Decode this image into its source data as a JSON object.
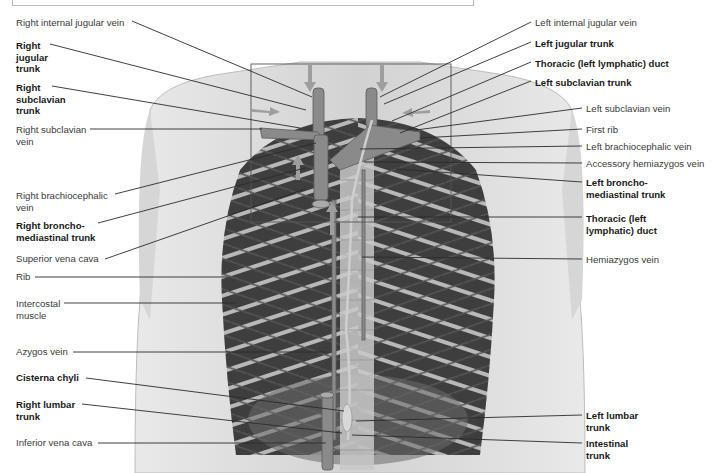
{
  "figure": {
    "inset_box": "highlighted region of jugular, subclavian and bronchomediastinal trunks",
    "colors": {
      "background": "#ffffff",
      "skin": "#dcdcdc",
      "muscle_dark": "#3c3c3c",
      "vessel": "#8a8a8a",
      "line": "#2b2b2b",
      "arrow": "#9a9a9a"
    }
  },
  "labels_left": [
    {
      "id": "right-internal-jugular-vein",
      "text": "Right internal jugular vein",
      "bold": false,
      "x": 16,
      "y": 17
    },
    {
      "id": "right-jugular-trunk",
      "text": "Right\njugular\ntrunk",
      "bold": true,
      "x": 16,
      "y": 40
    },
    {
      "id": "right-subclavian-trunk",
      "text": "Right\nsubclavian\ntrunk",
      "bold": true,
      "x": 16,
      "y": 82
    },
    {
      "id": "right-subclavian-vein",
      "text": "Right subclavian\nvein",
      "bold": false,
      "x": 16,
      "y": 124
    },
    {
      "id": "right-brachiocephalic-vein",
      "text": "Right brachiocephalic\nvein",
      "bold": false,
      "x": 16,
      "y": 190
    },
    {
      "id": "right-bronchomediastinal-trunk",
      "text": "Right broncho-\nmediastinal trunk",
      "bold": true,
      "x": 16,
      "y": 220
    },
    {
      "id": "superior-vena-cava",
      "text": "Superior vena cava",
      "bold": false,
      "x": 16,
      "y": 253
    },
    {
      "id": "rib",
      "text": "Rib",
      "bold": false,
      "x": 16,
      "y": 271
    },
    {
      "id": "intercostal-muscle",
      "text": "Intercostal\nmuscle",
      "bold": false,
      "x": 16,
      "y": 298
    },
    {
      "id": "azygos-vein",
      "text": "Azygos vein",
      "bold": false,
      "x": 16,
      "y": 346
    },
    {
      "id": "cisterna-chyli",
      "text": "Cisterna chyli",
      "bold": true,
      "x": 16,
      "y": 372
    },
    {
      "id": "right-lumbar-trunk",
      "text": "Right lumbar\ntrunk",
      "bold": true,
      "x": 16,
      "y": 399
    },
    {
      "id": "inferior-vena-cava",
      "text": "Inferior vena cava",
      "bold": false,
      "x": 16,
      "y": 437
    }
  ],
  "labels_right": [
    {
      "id": "left-internal-jugular-vein",
      "text": "Left internal jugular vein",
      "bold": false,
      "x": 535,
      "y": 17
    },
    {
      "id": "left-jugular-trunk",
      "text": "Left jugular trunk",
      "bold": true,
      "x": 535,
      "y": 38
    },
    {
      "id": "thoracic-duct-top",
      "text": "Thoracic (left lymphatic) duct",
      "bold": true,
      "x": 535,
      "y": 58
    },
    {
      "id": "left-subclavian-trunk",
      "text": "Left subclavian trunk",
      "bold": true,
      "x": 535,
      "y": 77
    },
    {
      "id": "left-subclavian-vein",
      "text": "Left subclavian vein",
      "bold": false,
      "x": 586,
      "y": 103
    },
    {
      "id": "first-rib",
      "text": "First rib",
      "bold": false,
      "x": 586,
      "y": 124
    },
    {
      "id": "left-brachiocephalic-vein",
      "text": "Left brachiocephalic vein",
      "bold": false,
      "x": 586,
      "y": 141
    },
    {
      "id": "accessory-hemiazygos-vein",
      "text": "Accessory hemiazygos vein",
      "bold": false,
      "x": 586,
      "y": 158
    },
    {
      "id": "left-bronchomediastinal-trunk",
      "text": "Left broncho-\nmediastinal trunk",
      "bold": true,
      "x": 586,
      "y": 177
    },
    {
      "id": "thoracic-duct-lower",
      "text": "Thoracic (left\nlymphatic) duct",
      "bold": true,
      "x": 586,
      "y": 213
    },
    {
      "id": "hemiazygos-vein",
      "text": "Hemiazygos vein",
      "bold": false,
      "x": 586,
      "y": 254
    },
    {
      "id": "left-lumbar-trunk",
      "text": "Left lumbar\ntrunk",
      "bold": true,
      "x": 586,
      "y": 410
    },
    {
      "id": "intestinal-trunk",
      "text": "Intestinal\ntrunk",
      "bold": true,
      "x": 586,
      "y": 438
    }
  ],
  "leader_lines": [
    {
      "for": "right-internal-jugular-vein",
      "x1": 132,
      "y1": 21,
      "x2": 312,
      "y2": 97
    },
    {
      "for": "right-jugular-trunk",
      "x1": 50,
      "y1": 44,
      "x2": 306,
      "y2": 110
    },
    {
      "for": "right-subclavian-trunk",
      "x1": 52,
      "y1": 86,
      "x2": 300,
      "y2": 128
    },
    {
      "for": "right-subclavian-vein",
      "x1": 90,
      "y1": 129,
      "x2": 262,
      "y2": 129
    },
    {
      "for": "right-brachiocephalic-vein",
      "x1": 115,
      "y1": 194,
      "x2": 316,
      "y2": 143
    },
    {
      "for": "right-bronchomediastinal-trunk",
      "x1": 98,
      "y1": 223,
      "x2": 305,
      "y2": 168
    },
    {
      "for": "superior-vena-cava",
      "x1": 105,
      "y1": 259,
      "x2": 305,
      "y2": 189
    },
    {
      "for": "rib",
      "x1": 35,
      "y1": 277,
      "x2": 228,
      "y2": 277
    },
    {
      "for": "intercostal-muscle",
      "x1": 64,
      "y1": 303,
      "x2": 236,
      "y2": 303
    },
    {
      "for": "azygos-vein",
      "x1": 73,
      "y1": 352,
      "x2": 326,
      "y2": 352
    },
    {
      "for": "cisterna-chyli",
      "x1": 86,
      "y1": 378,
      "x2": 344,
      "y2": 411
    },
    {
      "for": "right-lumbar-trunk",
      "x1": 82,
      "y1": 404,
      "x2": 342,
      "y2": 433
    },
    {
      "for": "inferior-vena-cava",
      "x1": 98,
      "y1": 443,
      "x2": 326,
      "y2": 443
    },
    {
      "for": "left-internal-jugular-vein",
      "x1": 531,
      "y1": 22,
      "x2": 380,
      "y2": 97
    },
    {
      "for": "left-jugular-trunk",
      "x1": 531,
      "y1": 42,
      "x2": 384,
      "y2": 104
    },
    {
      "for": "thoracic-duct-top",
      "x1": 531,
      "y1": 62,
      "x2": 392,
      "y2": 121
    },
    {
      "for": "left-subclavian-trunk",
      "x1": 531,
      "y1": 81,
      "x2": 400,
      "y2": 133
    },
    {
      "for": "left-subclavian-vein",
      "x1": 582,
      "y1": 108,
      "x2": 416,
      "y2": 130
    },
    {
      "for": "first-rib",
      "x1": 582,
      "y1": 129,
      "x2": 420,
      "y2": 138
    },
    {
      "for": "left-brachiocephalic-vein",
      "x1": 582,
      "y1": 146,
      "x2": 360,
      "y2": 149
    },
    {
      "for": "accessory-hemiazygos-vein",
      "x1": 582,
      "y1": 163,
      "x2": 364,
      "y2": 162
    },
    {
      "for": "left-bronchomediastinal-trunk",
      "x1": 582,
      "y1": 182,
      "x2": 396,
      "y2": 169
    },
    {
      "for": "thoracic-duct-lower",
      "x1": 582,
      "y1": 217,
      "x2": 358,
      "y2": 217
    },
    {
      "for": "hemiazygos-vein",
      "x1": 582,
      "y1": 259,
      "x2": 362,
      "y2": 257
    },
    {
      "for": "left-lumbar-trunk",
      "x1": 582,
      "y1": 415,
      "x2": 356,
      "y2": 421
    },
    {
      "for": "intestinal-trunk",
      "x1": 582,
      "y1": 443,
      "x2": 352,
      "y2": 435
    }
  ]
}
